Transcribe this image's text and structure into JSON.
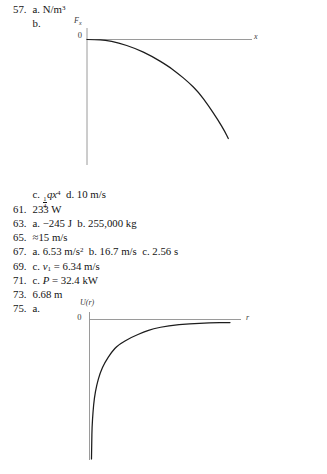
{
  "page": {
    "background": "#ffffff",
    "text_color": "#141414"
  },
  "colors": {
    "axis": "#8e8e8e",
    "curve": "#1c1c1c"
  },
  "answers": [
    {
      "num": "57.",
      "segments": [
        [
          "plain",
          "a. N/m"
        ],
        [
          "sup",
          "3"
        ]
      ]
    },
    {
      "num": "",
      "segments": [
        [
          "plain",
          "b."
        ]
      ]
    },
    {
      "graph": "fx-vs-x"
    },
    {
      "num": "",
      "segments": [
        [
          "plain",
          "c. "
        ],
        [
          "frac",
          "1",
          "4"
        ],
        [
          "italic",
          "qx"
        ],
        [
          "sup",
          "4"
        ],
        [
          "plain",
          "  d. 10 m/s"
        ]
      ]
    },
    {
      "num": "61.",
      "segments": [
        [
          "plain",
          "233 W"
        ]
      ]
    },
    {
      "num": "63.",
      "segments": [
        [
          "plain",
          "a. −245 J  b. 255,000 kg"
        ]
      ]
    },
    {
      "num": "65.",
      "segments": [
        [
          "plain",
          "≈15 m/s"
        ]
      ]
    },
    {
      "num": "67.",
      "segments": [
        [
          "plain",
          "a. 6.53 m/s"
        ],
        [
          "sup",
          "2"
        ],
        [
          "plain",
          "  b. 16.7 m/s  c. 2.56 s"
        ]
      ]
    },
    {
      "num": "69.",
      "segments": [
        [
          "plain",
          "c. "
        ],
        [
          "italic",
          "v"
        ],
        [
          "sub",
          "1"
        ],
        [
          "plain",
          " = 6.34 m/s"
        ]
      ]
    },
    {
      "num": "71.",
      "segments": [
        [
          "plain",
          "c. "
        ],
        [
          "italic",
          "P"
        ],
        [
          "plain",
          " = 32.4 kW"
        ]
      ]
    },
    {
      "num": "73.",
      "segments": [
        [
          "plain",
          "6.68 m"
        ]
      ]
    },
    {
      "num": "75.",
      "segments": [
        [
          "plain",
          "a."
        ]
      ]
    },
    {
      "graph": "ur-vs-r"
    }
  ],
  "chart_data": [
    {
      "id": "fx-vs-x",
      "type": "line",
      "title": "",
      "y_axis_label": {
        "base": "F",
        "subscript": "x"
      },
      "x_axis_label": "x",
      "origin_tick_label": "0",
      "x_ticks": [],
      "y_ticks": [
        "0"
      ],
      "points_normalized": [
        [
          0,
          0
        ],
        [
          0.06,
          0.002
        ],
        [
          0.127,
          0.007
        ],
        [
          0.222,
          0.033
        ],
        [
          0.34,
          0.088
        ],
        [
          0.458,
          0.168
        ],
        [
          0.575,
          0.269
        ],
        [
          0.646,
          0.345
        ],
        [
          0.717,
          0.43
        ],
        [
          0.788,
          0.53
        ],
        [
          0.858,
          0.665
        ],
        [
          0.929,
          0.816
        ],
        [
          0.977,
          0.933
        ],
        [
          1,
          1
        ]
      ]
    },
    {
      "id": "ur-vs-r",
      "type": "line",
      "title": "",
      "y_axis_label": {
        "base": "U(r)",
        "subscript": ""
      },
      "x_axis_label": "r",
      "origin_tick_label": "0",
      "x_ticks": [],
      "y_ticks": [
        "0"
      ],
      "points_normalized": [
        [
          0.014,
          1
        ],
        [
          0.016,
          0.88
        ],
        [
          0.018,
          0.77
        ],
        [
          0.025,
          0.663
        ],
        [
          0.034,
          0.563
        ],
        [
          0.051,
          0.47
        ],
        [
          0.075,
          0.384
        ],
        [
          0.11,
          0.305
        ],
        [
          0.158,
          0.233
        ],
        [
          0.203,
          0.183
        ],
        [
          0.302,
          0.125
        ],
        [
          0.388,
          0.09
        ],
        [
          0.452,
          0.066
        ],
        [
          0.56,
          0.045
        ],
        [
          0.715,
          0.03
        ],
        [
          0.85,
          0.024
        ],
        [
          1,
          0.022
        ]
      ]
    }
  ]
}
